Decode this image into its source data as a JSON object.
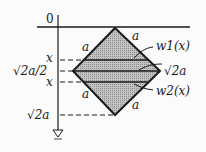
{
  "diagram": {
    "origin_label": "0",
    "axis_labels": {
      "x_upper": "x",
      "mid": "√2a/2",
      "x_lower": "x",
      "bottom": "√2a"
    },
    "side_labels": {
      "top_left": "a",
      "top_right": "a",
      "bottom_left": "a",
      "bottom_right": "a"
    },
    "callouts": {
      "w1": "w1(x)",
      "diag": "√2a",
      "w2": "w2(x)"
    },
    "colors": {
      "stroke": "#1a1a1a",
      "fill": "#b8b8b8",
      "background": "#fbfbfb"
    }
  }
}
